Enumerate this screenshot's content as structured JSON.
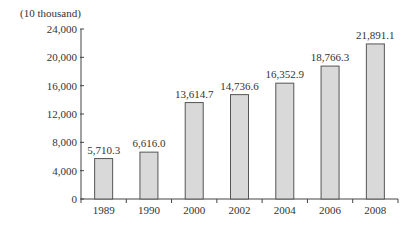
{
  "chart_data": {
    "type": "bar",
    "title": "",
    "unit_label": "(10 thousand)",
    "xlabel": "",
    "ylabel": "(10 thousand)",
    "categories": [
      "1989",
      "1990",
      "2000",
      "2002",
      "2004",
      "2006",
      "2008"
    ],
    "values": [
      5710.3,
      6616.0,
      13614.7,
      14736.6,
      16352.9,
      18766.3,
      21891.1
    ],
    "value_labels": [
      "5,710.3",
      "6,616.0",
      "13,614.7",
      "14,736.6",
      "16,352.9",
      "18,766.3",
      "21,891.1"
    ],
    "ylim": [
      0,
      24000
    ],
    "yticks": [
      0,
      4000,
      8000,
      12000,
      16000,
      20000,
      24000
    ],
    "ytick_labels": [
      "0",
      "4,000",
      "8,000",
      "12,000",
      "16,000",
      "20,000",
      "24,000"
    ],
    "grid": false,
    "legend": null,
    "colors": {
      "bar_fill": "#d9d9d9",
      "bar_edge": "#555555",
      "axis": "#444444"
    }
  }
}
